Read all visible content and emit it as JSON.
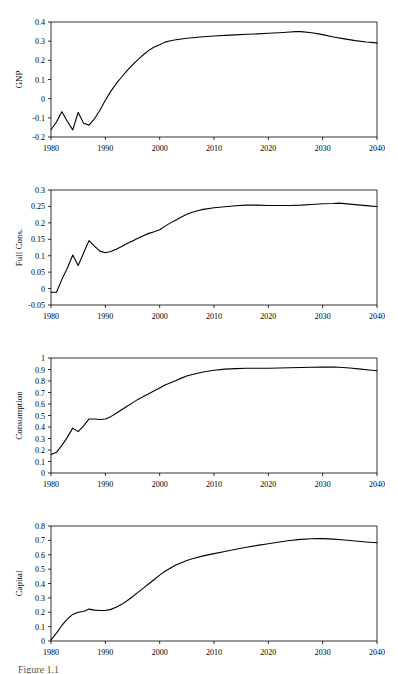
{
  "figure": {
    "caption": "Figure 1.1",
    "panel_count": 4
  },
  "chart_data": [
    {
      "type": "line",
      "title": "",
      "ylabel": "GNP",
      "xlabel": "",
      "xlim": [
        1980,
        2040
      ],
      "ylim": [
        -0.2,
        0.4
      ],
      "xticks": [
        1980,
        1990,
        2000,
        2010,
        2020,
        2030,
        2040
      ],
      "xticklabels": [
        "1980",
        "1990",
        "2000",
        "2010",
        "2020",
        "2030",
        "2040"
      ],
      "yticks": [
        -0.2,
        -0.1,
        0,
        0.1,
        0.2,
        0.3,
        0.4
      ],
      "yticklabels": [
        "-0.2",
        "-0.1",
        "0",
        "0.1",
        "0.2",
        "0.3",
        "0.4"
      ],
      "grid": false,
      "legend": "none",
      "x": [
        1980,
        1981,
        1982,
        1983,
        1984,
        1985,
        1986,
        1987,
        1988,
        1989,
        1990,
        1991,
        1992,
        1993,
        1994,
        1995,
        1996,
        1997,
        1998,
        1999,
        2000,
        2001,
        2002,
        2003,
        2004,
        2005,
        2006,
        2008,
        2010,
        2012,
        2014,
        2016,
        2018,
        2020,
        2022,
        2024,
        2025,
        2026,
        2028,
        2030,
        2032,
        2034,
        2036,
        2038,
        2040
      ],
      "y": [
        -0.162,
        -0.122,
        -0.068,
        -0.118,
        -0.163,
        -0.072,
        -0.128,
        -0.138,
        -0.105,
        -0.06,
        -0.008,
        0.038,
        0.078,
        0.113,
        0.146,
        0.176,
        0.204,
        0.229,
        0.252,
        0.27,
        0.281,
        0.295,
        0.302,
        0.307,
        0.311,
        0.315,
        0.318,
        0.323,
        0.327,
        0.33,
        0.333,
        0.336,
        0.338,
        0.341,
        0.344,
        0.348,
        0.35,
        0.35,
        0.344,
        0.334,
        0.322,
        0.312,
        0.303,
        0.296,
        0.291
      ]
    },
    {
      "type": "line",
      "title": "",
      "ylabel": "Full Cons.",
      "xlabel": "",
      "xlim": [
        1980,
        2040
      ],
      "ylim": [
        -0.05,
        0.3
      ],
      "xticks": [
        1980,
        1990,
        2000,
        2010,
        2020,
        2030,
        2040
      ],
      "xticklabels": [
        "1980",
        "1990",
        "2000",
        "2010",
        "2020",
        "2030",
        "2040"
      ],
      "yticks": [
        -0.05,
        0,
        0.05,
        0.1,
        0.15,
        0.2,
        0.25,
        0.3
      ],
      "yticklabels": [
        "-0.05",
        "0",
        "0.05",
        "0.1",
        "0.15",
        "0.2",
        "0.25",
        "0.3"
      ],
      "grid": false,
      "legend": "none",
      "x": [
        1980,
        1981,
        1982,
        1983,
        1984,
        1985,
        1986,
        1987,
        1988,
        1989,
        1990,
        1991,
        1992,
        1993,
        1994,
        1995,
        1996,
        1997,
        1998,
        1999,
        2000,
        2001,
        2002,
        2003,
        2004,
        2005,
        2006,
        2007,
        2008,
        2010,
        2012,
        2014,
        2016,
        2018,
        2020,
        2022,
        2024,
        2026,
        2028,
        2030,
        2032,
        2033,
        2035,
        2037,
        2039,
        2040
      ],
      "y": [
        -0.011,
        -0.011,
        0.028,
        0.062,
        0.102,
        0.07,
        0.108,
        0.146,
        0.129,
        0.114,
        0.109,
        0.113,
        0.12,
        0.128,
        0.137,
        0.145,
        0.153,
        0.161,
        0.168,
        0.173,
        0.179,
        0.19,
        0.2,
        0.209,
        0.218,
        0.226,
        0.232,
        0.237,
        0.241,
        0.246,
        0.249,
        0.252,
        0.254,
        0.254,
        0.253,
        0.253,
        0.253,
        0.254,
        0.256,
        0.258,
        0.259,
        0.26,
        0.257,
        0.254,
        0.251,
        0.25
      ]
    },
    {
      "type": "line",
      "title": "",
      "ylabel": "Consumption",
      "xlabel": "",
      "xlim": [
        1980,
        2040
      ],
      "ylim": [
        0,
        1
      ],
      "xticks": [
        1980,
        1990,
        2000,
        2010,
        2020,
        2030,
        2040
      ],
      "xticklabels": [
        "1980",
        "1990",
        "2000",
        "2010",
        "2020",
        "2030",
        "2040"
      ],
      "yticks": [
        0,
        0.1,
        0.2,
        0.3,
        0.4,
        0.5,
        0.6,
        0.7,
        0.8,
        0.9,
        1
      ],
      "yticklabels": [
        "0",
        "0.1",
        "0.2",
        "0.3",
        "0.4",
        "0.5",
        "0.6",
        "0.7",
        "0.8",
        "0.9",
        "1"
      ],
      "grid": false,
      "legend": "none",
      "x": [
        1980,
        1981,
        1982,
        1983,
        1984,
        1985,
        1986,
        1987,
        1988,
        1989,
        1990,
        1991,
        1992,
        1993,
        1994,
        1995,
        1996,
        1997,
        1998,
        1999,
        2000,
        2001,
        2002,
        2003,
        2004,
        2005,
        2006,
        2008,
        2010,
        2012,
        2014,
        2016,
        2018,
        2020,
        2022,
        2024,
        2026,
        2028,
        2030,
        2032,
        2033,
        2035,
        2037,
        2039,
        2040
      ],
      "y": [
        0.16,
        0.18,
        0.24,
        0.31,
        0.39,
        0.36,
        0.41,
        0.47,
        0.47,
        0.465,
        0.47,
        0.49,
        0.52,
        0.55,
        0.58,
        0.61,
        0.64,
        0.665,
        0.69,
        0.715,
        0.74,
        0.765,
        0.785,
        0.805,
        0.825,
        0.843,
        0.857,
        0.878,
        0.893,
        0.903,
        0.908,
        0.911,
        0.911,
        0.911,
        0.913,
        0.915,
        0.917,
        0.92,
        0.921,
        0.921,
        0.92,
        0.913,
        0.903,
        0.894,
        0.889
      ]
    },
    {
      "type": "line",
      "title": "",
      "ylabel": "Capital",
      "xlabel": "",
      "xlim": [
        1980,
        2040
      ],
      "ylim": [
        0,
        0.8
      ],
      "xticks": [
        1980,
        1990,
        2000,
        2010,
        2020,
        2030,
        2040
      ],
      "xticklabels": [
        "1980",
        "1990",
        "2000",
        "2010",
        "2020",
        "2030",
        "2040"
      ],
      "yticks": [
        0,
        0.1,
        0.2,
        0.3,
        0.4,
        0.5,
        0.6,
        0.7,
        0.8
      ],
      "yticklabels": [
        "0",
        "0.1",
        "0.2",
        "0.3",
        "0.4",
        "0.5",
        "0.6",
        "0.7",
        "0.8"
      ],
      "grid": false,
      "legend": "none",
      "x": [
        1980,
        1981,
        1982,
        1983,
        1984,
        1985,
        1986,
        1987,
        1988,
        1989,
        1990,
        1991,
        1992,
        1993,
        1994,
        1995,
        1996,
        1997,
        1998,
        1999,
        2000,
        2001,
        2002,
        2003,
        2004,
        2005,
        2006,
        2008,
        2010,
        2012,
        2014,
        2016,
        2018,
        2020,
        2022,
        2024,
        2026,
        2028,
        2029,
        2030,
        2032,
        2034,
        2036,
        2038,
        2040
      ],
      "y": [
        0.008,
        0.055,
        0.108,
        0.152,
        0.185,
        0.2,
        0.205,
        0.222,
        0.215,
        0.212,
        0.212,
        0.22,
        0.235,
        0.255,
        0.28,
        0.308,
        0.338,
        0.368,
        0.398,
        0.428,
        0.458,
        0.485,
        0.508,
        0.528,
        0.545,
        0.56,
        0.572,
        0.592,
        0.608,
        0.623,
        0.638,
        0.652,
        0.665,
        0.677,
        0.689,
        0.699,
        0.707,
        0.711,
        0.712,
        0.712,
        0.709,
        0.703,
        0.696,
        0.689,
        0.683
      ]
    }
  ]
}
